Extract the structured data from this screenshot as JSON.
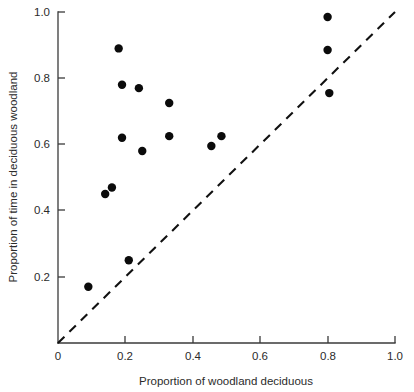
{
  "chart_data": {
    "type": "scatter",
    "title": "",
    "xlabel": "Proportion of woodland deciduous",
    "ylabel": "Proportion of time in deciduous woodland",
    "xlim": [
      0,
      1.0
    ],
    "ylim": [
      0,
      1.0
    ],
    "grid": false,
    "legend": null,
    "x_ticks": [
      0,
      0.2,
      0.4,
      0.6,
      0.8,
      1.0
    ],
    "x_tick_labels": [
      "0",
      "0.2",
      "0.4",
      "0.6",
      "0.8",
      "1.0"
    ],
    "y_ticks": [
      0.2,
      0.4,
      0.6,
      0.8,
      1.0
    ],
    "y_tick_labels": [
      "0.2",
      "0.4",
      "0.6",
      "0.8",
      "1.0"
    ],
    "series": [
      {
        "name": "observations",
        "marker": "filled-circle",
        "color": "#0b0b0b",
        "points": [
          {
            "x": 0.09,
            "y": 0.17
          },
          {
            "x": 0.14,
            "y": 0.45
          },
          {
            "x": 0.16,
            "y": 0.47
          },
          {
            "x": 0.18,
            "y": 0.89
          },
          {
            "x": 0.19,
            "y": 0.78
          },
          {
            "x": 0.19,
            "y": 0.62
          },
          {
            "x": 0.21,
            "y": 0.25
          },
          {
            "x": 0.24,
            "y": 0.77
          },
          {
            "x": 0.25,
            "y": 0.58
          },
          {
            "x": 0.33,
            "y": 0.725
          },
          {
            "x": 0.33,
            "y": 0.625
          },
          {
            "x": 0.455,
            "y": 0.595
          },
          {
            "x": 0.485,
            "y": 0.625
          },
          {
            "x": 0.8,
            "y": 0.985
          },
          {
            "x": 0.8,
            "y": 0.885
          },
          {
            "x": 0.805,
            "y": 0.755
          }
        ]
      }
    ],
    "annotations": [
      {
        "name": "identity-reference-line",
        "type": "line",
        "style": "dashed",
        "from": {
          "x": 0.0,
          "y": 0.0
        },
        "to": {
          "x": 1.0,
          "y": 1.0
        },
        "label": ""
      }
    ]
  }
}
